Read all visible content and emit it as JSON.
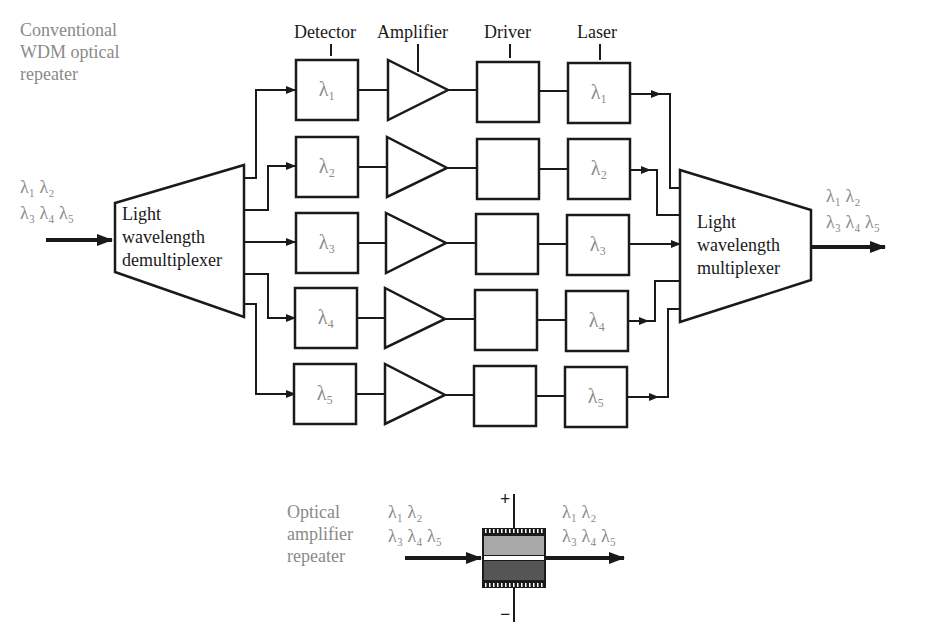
{
  "diagram": {
    "type": "block-diagram",
    "title_label": [
      "Conventional",
      "WDM optical",
      "repeater"
    ],
    "column_headers": [
      "Detector",
      "Amplifier",
      "Driver",
      "Laser"
    ],
    "input": {
      "wavelengths_line1": "λ₁  λ₂",
      "wavelengths_line2": "λ₃  λ₄  λ₅"
    },
    "demultiplexer": {
      "label": [
        "Light",
        "wavelength",
        "demultiplexer"
      ]
    },
    "multiplexer": {
      "label": [
        "Light",
        "wavelength",
        "multiplexer"
      ]
    },
    "output": {
      "wavelengths_line1": "λ₁  λ₂",
      "wavelengths_line2": "λ₃  λ₄  λ₅"
    },
    "channels": [
      {
        "detector": "λ₁",
        "laser": "λ₁"
      },
      {
        "detector": "λ₂",
        "laser": "λ₂"
      },
      {
        "detector": "λ₃",
        "laser": "λ₃"
      },
      {
        "detector": "λ₄",
        "laser": "λ₄"
      },
      {
        "detector": "λ₅",
        "laser": "λ₅"
      }
    ],
    "optical_amplifier": {
      "label": [
        "Optical",
        "amplifier",
        "repeater"
      ],
      "input_line1": "λ₁  λ₂",
      "input_line2": "λ₃  λ₄  λ₅",
      "output_line1": "λ₁  λ₂",
      "output_line2": "λ₃  λ₄  λ₅",
      "plus": "+",
      "minus": "−"
    },
    "colors": {
      "line": "#1a1a1a",
      "gray_text": "#8a8a8a",
      "upper_layer": "#a8a8a8",
      "lower_layer": "#555555"
    }
  }
}
